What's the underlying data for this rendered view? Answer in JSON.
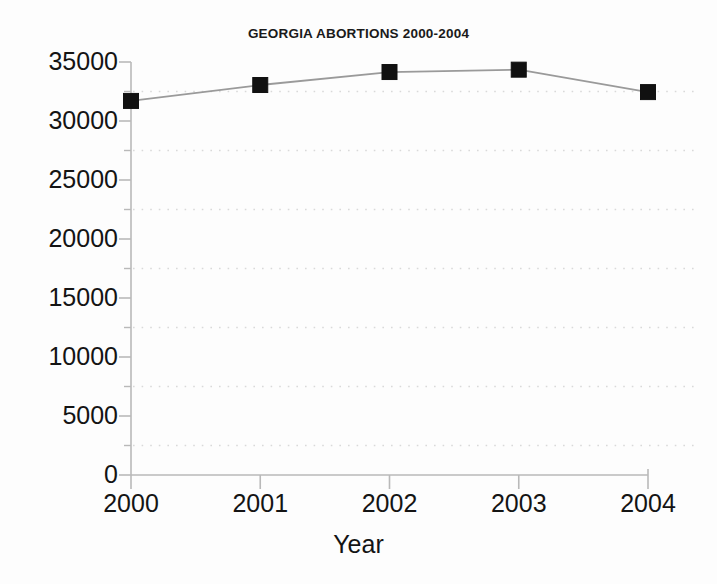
{
  "chart_data": {
    "type": "line",
    "title": "GEORGIA ABORTIONS 2000-2004",
    "xlabel": "Year",
    "ylabel": "",
    "categories": [
      "2000",
      "2001",
      "2002",
      "2003",
      "2004"
    ],
    "x": [
      2000,
      2001,
      2002,
      2003,
      2004
    ],
    "values": [
      31700,
      33050,
      34150,
      34350,
      32450
    ],
    "series": [
      {
        "name": "Georgia abortions",
        "values": [
          31700,
          33050,
          34150,
          34350,
          32450
        ]
      }
    ],
    "ylim": [
      0,
      35000
    ],
    "xlim": [
      2000,
      2004
    ],
    "ytick_labels": [
      "35000",
      "30000",
      "25000",
      "20000",
      "15000",
      "10000",
      "5000",
      "0"
    ],
    "ytick_values": [
      35000,
      30000,
      25000,
      20000,
      15000,
      10000,
      5000,
      0
    ],
    "yminor_tick_values": [
      32500,
      27500,
      22500,
      17500,
      12500,
      7500,
      2500
    ],
    "xtick_labels": [
      "2000",
      "2001",
      "2002",
      "2003",
      "2004"
    ],
    "grid": "horizontal-minor-dotted",
    "legend": "none",
    "marker": "square",
    "colors": {
      "line": "#9a9a9a",
      "marker": "#111111",
      "axis": "#b9b9b9",
      "grid": "#d9d9d9",
      "text": "#141414",
      "background": "#fdfdfd"
    }
  },
  "axes": {
    "title": "GEORGIA ABORTIONS 2000-2004",
    "x_axis_title": "Year",
    "y_ticks": [
      {
        "label": "35000",
        "value": 35000
      },
      {
        "label": "30000",
        "value": 30000
      },
      {
        "label": "25000",
        "value": 25000
      },
      {
        "label": "20000",
        "value": 20000
      },
      {
        "label": "15000",
        "value": 15000
      },
      {
        "label": "10000",
        "value": 10000
      },
      {
        "label": "5000",
        "value": 5000
      },
      {
        "label": "0",
        "value": 0
      }
    ],
    "x_ticks": [
      {
        "label": "2000",
        "value": 2000
      },
      {
        "label": "2001",
        "value": 2001
      },
      {
        "label": "2002",
        "value": 2002
      },
      {
        "label": "2003",
        "value": 2003
      },
      {
        "label": "2004",
        "value": 2004
      }
    ]
  }
}
